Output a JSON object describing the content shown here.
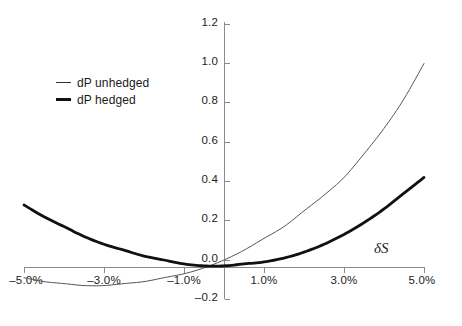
{
  "chart_data": {
    "type": "line",
    "title": "",
    "subtitle": "",
    "xlabel": "δS",
    "ylabel": "",
    "xlim": [
      -5.0,
      5.0
    ],
    "ylim": [
      -0.2,
      1.2
    ],
    "grid": false,
    "legend_position": "upper-left",
    "x_tick_labels": [
      "–5.0%",
      "–3.0%",
      "–1.0%",
      "1.0%",
      "3.0%",
      "5.0%"
    ],
    "x_tick_values": [
      -5.0,
      -3.0,
      -1.0,
      1.0,
      3.0,
      5.0
    ],
    "y_tick_labels": [
      "1.2",
      "1.0",
      "0.8",
      "0.6",
      "0.4",
      "0.2",
      "0.0",
      "–0.2"
    ],
    "y_tick_values": [
      1.2,
      1.0,
      0.8,
      0.6,
      0.4,
      0.2,
      0.0,
      -0.2
    ],
    "x": [
      -5.0,
      -4.5,
      -4.0,
      -3.5,
      -3.0,
      -2.5,
      -2.0,
      -1.5,
      -1.0,
      -0.5,
      0.0,
      0.5,
      1.0,
      1.5,
      2.0,
      2.5,
      3.0,
      3.5,
      4.0,
      4.5,
      5.0
    ],
    "series": [
      {
        "name": "dP unhedged",
        "line_width": "thin",
        "color": "#555555",
        "values": [
          -0.09,
          -0.11,
          -0.12,
          -0.13,
          -0.13,
          -0.12,
          -0.11,
          -0.09,
          -0.07,
          -0.04,
          0.0,
          0.05,
          0.11,
          0.17,
          0.25,
          0.33,
          0.42,
          0.54,
          0.67,
          0.82,
          1.0
        ]
      },
      {
        "name": "dP hedged",
        "line_width": "thick",
        "color": "#111111",
        "values": [
          0.28,
          0.22,
          0.17,
          0.12,
          0.08,
          0.05,
          0.02,
          0.0,
          -0.02,
          -0.03,
          -0.03,
          -0.02,
          -0.01,
          0.01,
          0.04,
          0.08,
          0.13,
          0.19,
          0.26,
          0.34,
          0.42
        ]
      }
    ],
    "annotations": [
      {
        "text": "δS",
        "x": 3.7,
        "y": 0.14,
        "style": "italic-serif"
      }
    ]
  },
  "legend": {
    "items": [
      {
        "label": "dP unhedged",
        "swatch": "thin-line-swatch"
      },
      {
        "label": "dP hedged",
        "swatch": "thick-line-swatch"
      }
    ]
  },
  "axes": {
    "y_labels": [
      "1.2",
      "1.0",
      "0.8",
      "0.6",
      "0.4",
      "0.2",
      "0.0",
      "–0.2"
    ],
    "x_labels": [
      "–5.0%",
      "–3.0%",
      "–1.0%",
      "1.0%",
      "3.0%",
      "5.0%"
    ],
    "x_axis_title": "δS"
  }
}
